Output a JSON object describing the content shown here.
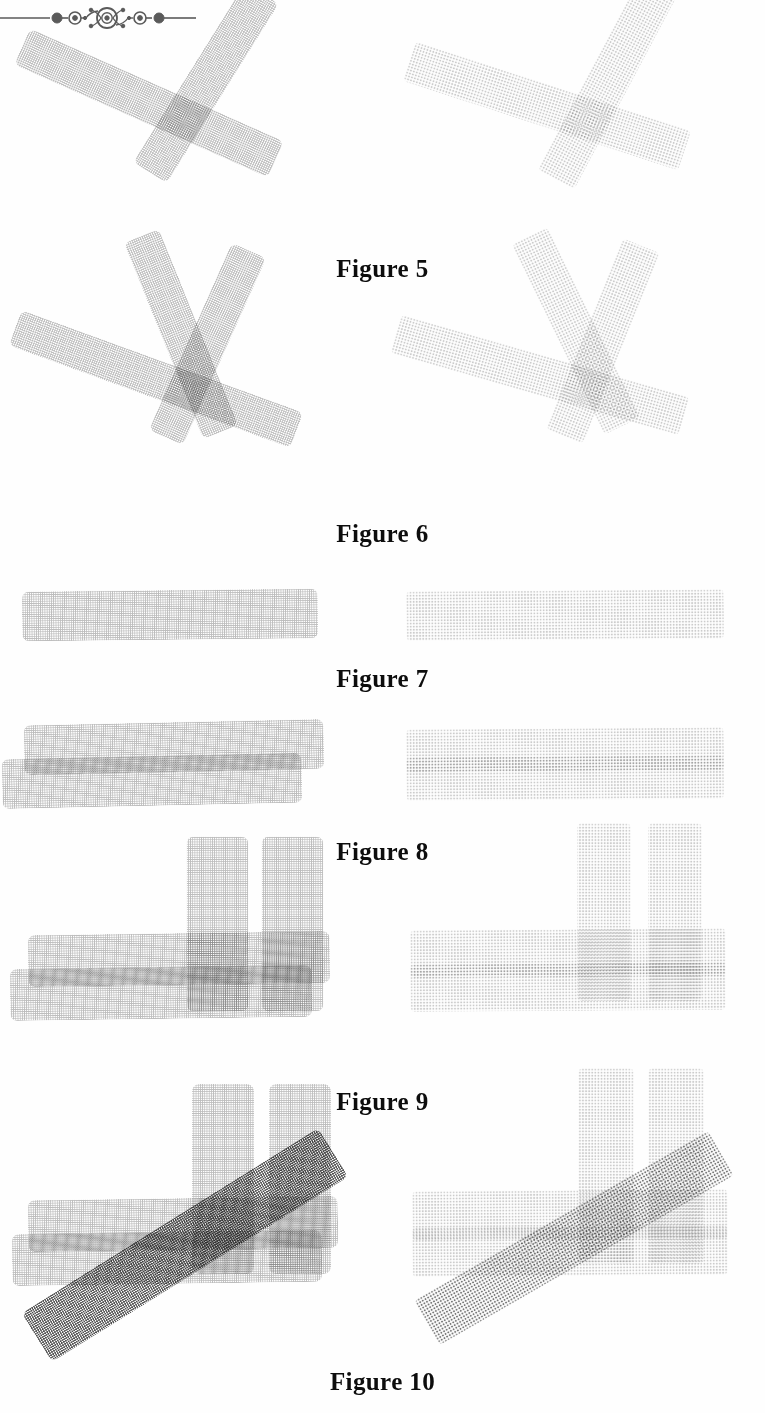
{
  "page": {
    "width": 765,
    "height": 1413,
    "background_color": "#ffffff",
    "ink_color": "#111111"
  },
  "ornament": {
    "name": "decorative-rule",
    "description": "printer's ornament: horizontal rule with dots, small ringed circles and a central starburst eye",
    "color": "#5a5a5a"
  },
  "figures": [
    {
      "id": "figure-5",
      "caption": "Figure 5",
      "top": 55,
      "height": 200,
      "caption_top": 255,
      "panels": [
        {
          "side": "left",
          "texture": "crisp",
          "bars": [
            {
              "name": "bar-diagonal-down",
              "tone": "t-light",
              "x": 10,
              "y": 28,
              "w": 278,
              "h": 40,
              "rot": 24
            },
            {
              "name": "bar-diagonal-up",
              "tone": "t-light",
              "x": 100,
              "y": 8,
              "w": 212,
              "h": 40,
              "rot": -58
            }
          ]
        },
        {
          "side": "right",
          "texture": "diffuse",
          "bars": [
            {
              "name": "bar-diagonal-down",
              "tone": "t-faint",
              "x": 12,
              "y": 30,
              "w": 290,
              "h": 42,
              "rot": 18
            },
            {
              "name": "bar-diagonal-up",
              "tone": "t-faint",
              "x": 105,
              "y": 2,
              "w": 230,
              "h": 42,
              "rot": -62
            }
          ]
        }
      ]
    },
    {
      "id": "figure-6",
      "caption": "Figure 6",
      "top": 305,
      "height": 205,
      "caption_top": 520,
      "panels": [
        {
          "side": "left",
          "texture": "crisp",
          "bars": [
            {
              "name": "bar-shallow-down",
              "tone": "t-light",
              "x": 6,
              "y": 55,
              "w": 300,
              "h": 38,
              "rot": 20
            },
            {
              "name": "bar-steep-down",
              "tone": "t-light",
              "x": 75,
              "y": 10,
              "w": 212,
              "h": 38,
              "rot": 68
            },
            {
              "name": "bar-steep-up",
              "tone": "t-light",
              "x": 105,
              "y": 20,
              "w": 205,
              "h": 38,
              "rot": -66
            }
          ]
        },
        {
          "side": "right",
          "texture": "diffuse",
          "bars": [
            {
              "name": "bar-shallow-down",
              "tone": "t-faint",
              "x": 0,
              "y": 50,
              "w": 300,
              "h": 40,
              "rot": 16
            },
            {
              "name": "bar-steep-down",
              "tone": "t-faint",
              "x": 80,
              "y": 6,
              "w": 212,
              "h": 40,
              "rot": 64
            },
            {
              "name": "bar-steep-up",
              "tone": "t-faint",
              "x": 110,
              "y": 16,
              "w": 206,
              "h": 40,
              "rot": -68
            }
          ]
        }
      ]
    },
    {
      "id": "figure-7",
      "caption": "Figure 7",
      "top": 580,
      "height": 80,
      "caption_top": 665,
      "panels": [
        {
          "side": "left",
          "texture": "crisp",
          "bars": [
            {
              "name": "bar-horizontal",
              "tone": "t-light",
              "x": 22,
              "y": 10,
              "w": 296,
              "h": 50,
              "rot": -0.6
            }
          ]
        },
        {
          "side": "right",
          "texture": "diffuse",
          "bars": [
            {
              "name": "bar-horizontal",
              "tone": "t-faint",
              "x": 16,
              "y": 10,
              "w": 318,
              "h": 50,
              "rot": -0.4
            }
          ]
        }
      ]
    },
    {
      "id": "figure-8",
      "caption": "Figure 8",
      "top": 718,
      "height": 112,
      "caption_top": 838,
      "panels": [
        {
          "side": "left",
          "texture": "crisp",
          "bars": [
            {
              "name": "bar-horizontal-upper",
              "tone": "t-light",
              "x": 24,
              "y": 4,
              "w": 300,
              "h": 50,
              "rot": -1.2
            },
            {
              "name": "bar-horizontal-lower",
              "tone": "t-light",
              "x": 2,
              "y": 38,
              "w": 300,
              "h": 50,
              "rot": -1.2
            }
          ]
        },
        {
          "side": "right",
          "texture": "diffuse",
          "bars": [
            {
              "name": "bar-horizontal-upper",
              "tone": "t-faint",
              "x": 16,
              "y": 10,
              "w": 318,
              "h": 44,
              "rot": -0.4
            },
            {
              "name": "bar-horizontal-lower",
              "tone": "t-faint",
              "x": 16,
              "y": 38,
              "w": 318,
              "h": 44,
              "rot": -0.4
            }
          ]
        }
      ]
    },
    {
      "id": "figure-9",
      "caption": "Figure 9",
      "top": 885,
      "height": 185,
      "caption_top": 1088,
      "panels": [
        {
          "side": "left",
          "texture": "crisp",
          "bars": [
            {
              "name": "bar-vertical-left",
              "tone": "t-light",
              "x": 130,
              "y": 8,
              "w": 175,
              "h": 62,
              "rot": 90
            },
            {
              "name": "bar-vertical-right",
              "tone": "t-light",
              "x": 205,
              "y": 8,
              "w": 175,
              "h": 62,
              "rot": 90
            },
            {
              "name": "bar-horizontal-upper",
              "tone": "t-light",
              "x": 28,
              "y": 48,
              "w": 302,
              "h": 52,
              "rot": -0.8
            },
            {
              "name": "bar-horizontal-lower",
              "tone": "t-light",
              "x": 10,
              "y": 82,
              "w": 302,
              "h": 52,
              "rot": -0.8
            }
          ]
        },
        {
          "side": "right",
          "texture": "diffuse",
          "bars": [
            {
              "name": "bar-vertical-left",
              "tone": "t-faint",
              "x": 125,
              "y": 0,
              "w": 178,
              "h": 54,
              "rot": 90
            },
            {
              "name": "bar-vertical-right",
              "tone": "t-faint",
              "x": 196,
              "y": 0,
              "w": 178,
              "h": 54,
              "rot": 90
            },
            {
              "name": "bar-horizontal-upper",
              "tone": "t-faint",
              "x": 20,
              "y": 44,
              "w": 316,
              "h": 48,
              "rot": -0.4
            },
            {
              "name": "bar-horizontal-lower",
              "tone": "t-faint",
              "x": 20,
              "y": 78,
              "w": 316,
              "h": 48,
              "rot": -0.4
            }
          ]
        }
      ]
    },
    {
      "id": "figure-10",
      "caption": "Figure 10",
      "top": 1128,
      "height": 220,
      "caption_top": 1368,
      "panels": [
        {
          "side": "left",
          "texture": "crisp",
          "bars": [
            {
              "name": "bar-vertical-left",
              "tone": "t-light",
              "x": 128,
              "y": 20,
              "w": 190,
              "h": 62,
              "rot": 90
            },
            {
              "name": "bar-vertical-right",
              "tone": "t-light",
              "x": 205,
              "y": 20,
              "w": 190,
              "h": 62,
              "rot": 90
            },
            {
              "name": "bar-horizontal-upper",
              "tone": "t-light",
              "x": 28,
              "y": 70,
              "w": 310,
              "h": 52,
              "rot": -0.8
            },
            {
              "name": "bar-horizontal-lower",
              "tone": "t-light",
              "x": 12,
              "y": 104,
              "w": 310,
              "h": 52,
              "rot": -0.8
            },
            {
              "name": "bar-diagonal-dark",
              "tone": "t-black",
              "x": 10,
              "y": 88,
              "w": 350,
              "h": 58,
              "rot": -32
            }
          ]
        },
        {
          "side": "right",
          "texture": "diffuse",
          "bars": [
            {
              "name": "bar-vertical-left",
              "tone": "t-faint",
              "x": 118,
              "y": 10,
              "w": 196,
              "h": 56,
              "rot": 90
            },
            {
              "name": "bar-vertical-right",
              "tone": "t-faint",
              "x": 188,
              "y": 10,
              "w": 196,
              "h": 56,
              "rot": 90
            },
            {
              "name": "bar-horizontal-upper",
              "tone": "t-faint",
              "x": 22,
              "y": 62,
              "w": 316,
              "h": 50,
              "rot": -0.4
            },
            {
              "name": "bar-horizontal-lower",
              "tone": "t-faint",
              "x": 22,
              "y": 98,
              "w": 316,
              "h": 50,
              "rot": -0.4
            },
            {
              "name": "bar-diagonal-dark",
              "tone": "t-dark",
              "x": 14,
              "y": 84,
              "w": 340,
              "h": 52,
              "rot": -30
            }
          ]
        }
      ]
    }
  ]
}
